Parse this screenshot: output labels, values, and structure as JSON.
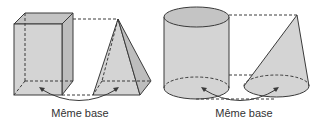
{
  "figures": {
    "left": {
      "solids": [
        "rectangular-prism",
        "square-pyramid"
      ],
      "caption": "Même base"
    },
    "right": {
      "solids": [
        "cylinder",
        "cone"
      ],
      "caption": "Même base"
    }
  },
  "colors": {
    "fill": "#d4d4d4",
    "fill_dark": "#bdbdbd",
    "fill_top": "#c4c4c4",
    "stroke": "#3a3a3a"
  }
}
